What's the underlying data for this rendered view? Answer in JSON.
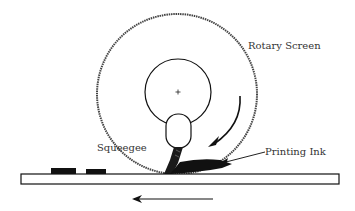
{
  "diagram": {
    "labels": {
      "rotary_screen": "Rotary Screen",
      "squeegee": "Squeegee",
      "printing_ink": "Printing Ink"
    },
    "center_mark": "+",
    "colors": {
      "line": "#111111",
      "dashed_outline": "#555555",
      "ink": "#111111",
      "background": "#ffffff"
    }
  }
}
